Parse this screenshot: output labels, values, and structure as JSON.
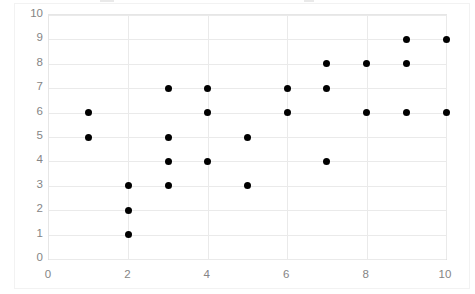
{
  "chart_data": {
    "type": "scatter",
    "title": "",
    "xlabel": "",
    "ylabel": "",
    "xlim": [
      0,
      10
    ],
    "ylim": [
      0,
      10
    ],
    "xticks": [
      0,
      2,
      4,
      6,
      8,
      10
    ],
    "yticks": [
      0,
      1,
      2,
      3,
      4,
      5,
      6,
      7,
      8,
      9,
      10
    ],
    "grid": true,
    "legend": null,
    "series": [
      {
        "name": "",
        "marker": "circle",
        "color": "#000000",
        "points": [
          [
            1,
            6
          ],
          [
            1,
            5
          ],
          [
            2,
            3
          ],
          [
            2,
            2
          ],
          [
            2,
            1
          ],
          [
            3,
            7
          ],
          [
            3,
            5
          ],
          [
            3,
            4
          ],
          [
            3,
            3
          ],
          [
            4,
            7
          ],
          [
            4,
            6
          ],
          [
            4,
            4
          ],
          [
            5,
            5
          ],
          [
            5,
            3
          ],
          [
            6,
            7
          ],
          [
            6,
            6
          ],
          [
            7,
            8
          ],
          [
            7,
            7
          ],
          [
            7,
            4
          ],
          [
            8,
            8
          ],
          [
            8,
            6
          ],
          [
            9,
            9
          ],
          [
            9,
            8
          ],
          [
            9,
            6
          ],
          [
            10,
            9
          ],
          [
            10,
            6
          ]
        ]
      }
    ],
    "x": [
      1,
      1,
      2,
      2,
      2,
      3,
      3,
      3,
      3,
      4,
      4,
      4,
      5,
      5,
      6,
      6,
      7,
      7,
      7,
      8,
      8,
      9,
      9,
      9,
      10,
      10
    ],
    "y": [
      6,
      5,
      3,
      2,
      1,
      7,
      5,
      4,
      3,
      7,
      6,
      4,
      5,
      3,
      7,
      6,
      8,
      7,
      4,
      8,
      6,
      9,
      8,
      6,
      9,
      6
    ]
  },
  "axes": {
    "y_tick_labels": [
      "10",
      "9",
      "8",
      "7",
      "6",
      "5",
      "4",
      "3",
      "2",
      "1",
      "0"
    ],
    "x_tick_labels": [
      "0",
      "2",
      "4",
      "6",
      "8",
      "10"
    ]
  },
  "colors": {
    "marker": "#000000",
    "gridline": "#eaeaea",
    "axis_border": "#e6e6e6",
    "tick_label": "#858585",
    "background": "#ffffff"
  }
}
